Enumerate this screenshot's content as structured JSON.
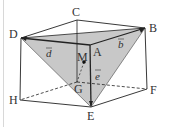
{
  "diagram": {
    "type": "cube-with-tetrahedron",
    "vertices": {
      "A": {
        "label": "A",
        "x": 90,
        "y": 45
      },
      "B": {
        "label": "B",
        "x": 145,
        "y": 28
      },
      "C": {
        "label": "C",
        "x": 77,
        "y": 20
      },
      "D": {
        "label": "D",
        "x": 21,
        "y": 38
      },
      "E": {
        "label": "E",
        "x": 91,
        "y": 107
      },
      "F": {
        "label": "F",
        "x": 147,
        "y": 89
      },
      "G": {
        "label": "G",
        "x": 77,
        "y": 82
      },
      "H": {
        "label": "H",
        "x": 20,
        "y": 100
      }
    },
    "point_M": {
      "label": "M",
      "x": 84,
      "y": 62
    },
    "vectors": {
      "b": {
        "label": "b"
      },
      "d": {
        "label": "d"
      },
      "e": {
        "label": "e"
      }
    },
    "colors": {
      "shade": "#c8c8c8",
      "edge": "#222222",
      "label": "#333333"
    }
  }
}
